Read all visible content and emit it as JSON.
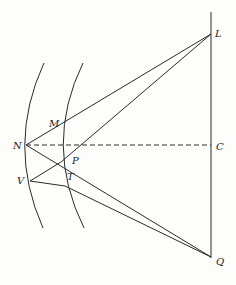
{
  "diagram": {
    "type": "geometric optics construction",
    "points": {
      "L": {
        "label": "L",
        "x": 211,
        "y": 34
      },
      "C": {
        "label": "C",
        "x": 211,
        "y": 145
      },
      "Q": {
        "label": "Q",
        "x": 211,
        "y": 257
      },
      "N": {
        "label": "N",
        "x": 26,
        "y": 145
      },
      "M": {
        "label": "M",
        "x": 61,
        "y": 129
      },
      "P": {
        "label": "P",
        "x": 61,
        "y": 162
      },
      "V": {
        "label": "V",
        "x": 30,
        "y": 181
      },
      "T": {
        "label": "T",
        "x": 65,
        "y": 186
      }
    },
    "labels": {
      "L": "L",
      "C": "C",
      "Q": "Q",
      "N": "N",
      "M": "M",
      "P": "P",
      "V": "V",
      "T": "T"
    },
    "colors": {
      "line": "#2a2a2a",
      "background": "#fdfdfc"
    }
  }
}
